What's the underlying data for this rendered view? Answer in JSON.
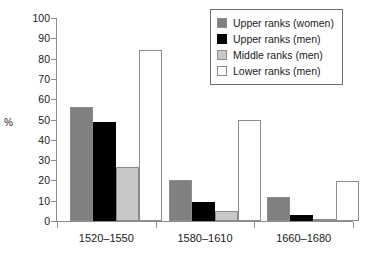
{
  "chart_data": {
    "type": "bar",
    "title": "",
    "subtitle": "",
    "xlabel": "",
    "ylabel": "%",
    "ylim": [
      0,
      100
    ],
    "yticks": [
      0,
      10,
      20,
      30,
      40,
      50,
      60,
      70,
      80,
      90,
      100
    ],
    "ytick_labels": [
      "0",
      "10",
      "20",
      "30",
      "40",
      "50",
      "60",
      "70",
      "80",
      "90",
      "100"
    ],
    "grid": false,
    "legend_position": "top-right",
    "categories": [
      "1520–1550",
      "1580–1610",
      "1660–1680"
    ],
    "series": [
      {
        "name": "Upper ranks (women)",
        "color": "#808080",
        "values": [
          56,
          20,
          12
        ]
      },
      {
        "name": "Upper ranks (men)",
        "color": "#000000",
        "values": [
          49,
          9.5,
          3
        ]
      },
      {
        "name": "Middle ranks (men)",
        "color": "#c8c8c8",
        "values": [
          26.5,
          5,
          1
        ]
      },
      {
        "name": "Lower ranks (men)",
        "color": "#ffffff",
        "values": [
          84,
          50,
          19.5
        ]
      }
    ]
  }
}
